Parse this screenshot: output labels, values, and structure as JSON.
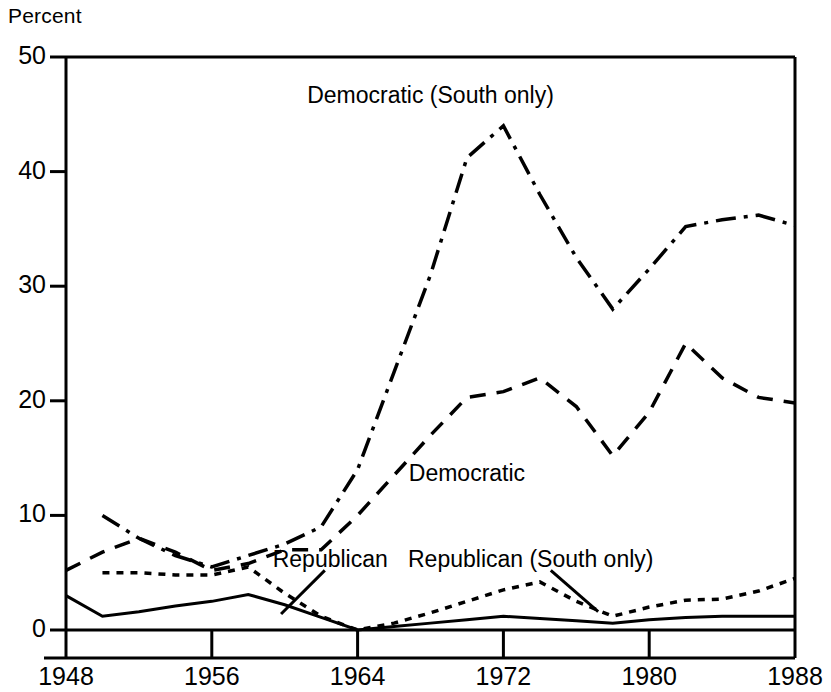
{
  "chart_data": {
    "type": "line",
    "title": "",
    "subtitle": "",
    "xlabel": "",
    "ylabel": "Percent",
    "ylim": [
      0,
      50
    ],
    "xlim": [
      1948,
      1988
    ],
    "yticks": [
      0,
      10,
      20,
      30,
      40,
      50
    ],
    "xticks": [
      1948,
      1956,
      1964,
      1972,
      1980,
      1988
    ],
    "ytick_labels": [
      "0",
      "10",
      "20",
      "30",
      "40",
      "50"
    ],
    "xtick_labels": [
      "1948",
      "1956",
      "1964",
      "1972",
      "1980",
      "1988"
    ],
    "grid": false,
    "legend_position": "inline-annotations",
    "x": [
      1948,
      1950,
      1952,
      1954,
      1956,
      1958,
      1960,
      1962,
      1964,
      1966,
      1968,
      1970,
      1972,
      1974,
      1976,
      1978,
      1980,
      1982,
      1984,
      1986,
      1988
    ],
    "series": [
      {
        "name": "Democratic (South only)",
        "style": "dash-dot",
        "x": [
          1950,
          1952,
          1954,
          1956,
          1958,
          1960,
          1962,
          1964,
          1966,
          1968,
          1970,
          1972,
          1974,
          1976,
          1978,
          1980,
          1982,
          1984,
          1986,
          1988
        ],
        "values": [
          10.0,
          8.0,
          6.5,
          5.5,
          6.5,
          7.5,
          9.0,
          14.0,
          22.5,
          31.0,
          41.2,
          44.0,
          38.0,
          32.5,
          28.0,
          31.5,
          35.2,
          35.8,
          36.2,
          35.3
        ]
      },
      {
        "name": "Democratic",
        "style": "dashed",
        "x": [
          1948,
          1950,
          1952,
          1954,
          1956,
          1958,
          1960,
          1962,
          1964,
          1966,
          1968,
          1970,
          1972,
          1974,
          1976,
          1978,
          1980,
          1982,
          1984,
          1986,
          1988
        ],
        "values": [
          5.2,
          6.8,
          8.0,
          6.8,
          5.2,
          5.8,
          7.0,
          7.0,
          10.0,
          13.5,
          17.0,
          20.3,
          20.8,
          22.0,
          19.5,
          15.2,
          19.0,
          25.0,
          22.0,
          20.3,
          19.8
        ]
      },
      {
        "name": "Republican (South only)",
        "style": "dotted",
        "x": [
          1950,
          1952,
          1954,
          1956,
          1958,
          1960,
          1962,
          1964,
          1966,
          1968,
          1970,
          1972,
          1974,
          1976,
          1978,
          1980,
          1982,
          1984,
          1986,
          1988
        ],
        "values": [
          5.0,
          5.0,
          4.8,
          4.8,
          5.5,
          3.2,
          1.2,
          0.0,
          0.6,
          1.5,
          2.5,
          3.5,
          4.2,
          2.5,
          1.2,
          2.0,
          2.6,
          2.7,
          3.4,
          4.5
        ]
      },
      {
        "name": "Republican",
        "style": "solid",
        "x": [
          1948,
          1950,
          1952,
          1954,
          1956,
          1958,
          1960,
          1962,
          1964,
          1966,
          1968,
          1970,
          1972,
          1974,
          1976,
          1978,
          1980,
          1982,
          1984,
          1986,
          1988
        ],
        "values": [
          3.0,
          1.2,
          1.6,
          2.1,
          2.5,
          3.1,
          2.2,
          1.1,
          0.0,
          0.3,
          0.6,
          0.9,
          1.2,
          1.0,
          0.8,
          0.6,
          0.9,
          1.1,
          1.2,
          1.2,
          1.2
        ]
      }
    ],
    "annotations": [
      {
        "text": "Democratic (South only)",
        "x": 1968,
        "y": 46.5
      },
      {
        "text": "Democratic",
        "x": 1970,
        "y": 13.5
      },
      {
        "text": "Republican",
        "x": 1962.5,
        "y": 6.0
      },
      {
        "text": "Republican (South only)",
        "x": 1973.5,
        "y": 6.0
      }
    ]
  }
}
